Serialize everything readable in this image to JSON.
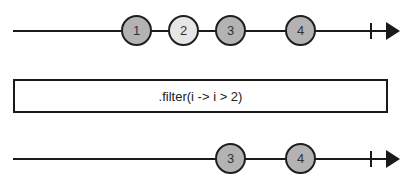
{
  "colors": {
    "line": "#1a1a1a",
    "marble_dark": "#b3b3b3",
    "marble_light": "#e6e6e6"
  },
  "input_stream": {
    "marbles": [
      {
        "label": "1",
        "x": 121,
        "fill": "#b3b3b3"
      },
      {
        "label": "2",
        "x": 168,
        "fill": "#e6e6e6"
      },
      {
        "label": "3",
        "x": 215,
        "fill": "#b3b3b3"
      },
      {
        "label": "4",
        "x": 285,
        "fill": "#b3b3b3"
      }
    ],
    "completion": "tick",
    "direction": "right-arrow"
  },
  "operator": {
    "label": ".filter(i -> i > 2)"
  },
  "output_stream": {
    "marbles": [
      {
        "label": "3",
        "x": 215,
        "fill": "#b3b3b3"
      },
      {
        "label": "4",
        "x": 285,
        "fill": "#b3b3b3"
      }
    ],
    "completion": "tick",
    "direction": "right-arrow"
  }
}
